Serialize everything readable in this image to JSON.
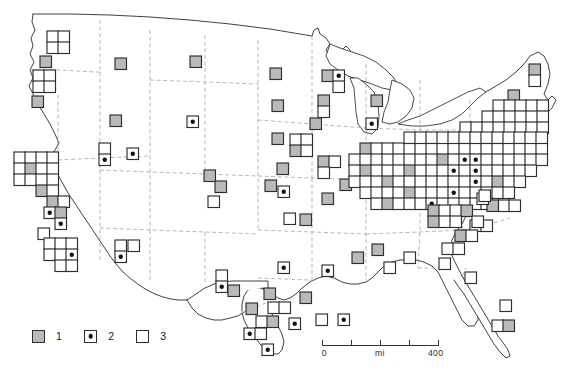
{
  "figure": {
    "projection": "conterminous United States, state boundaries shown dashed"
  },
  "legend": {
    "name": "map-legend",
    "entries": [
      {
        "symbol": "filled-gray-square",
        "label": "1"
      },
      {
        "symbol": "square-with-center-dot",
        "label": "2"
      },
      {
        "symbol": "open-white-square",
        "label": "3"
      }
    ]
  },
  "scalebar": {
    "unit_label": "mi",
    "min_label": "0",
    "max_label": "400",
    "ticks": [
      0,
      25,
      50,
      75,
      100
    ]
  },
  "colors": {
    "cell_fill_class1": "#b9b9b9",
    "cell_fill_class3": "#ffffff",
    "cell_stroke": "#2e2e2e",
    "dot": "#111111",
    "coastline": "#2b2b2b",
    "state_boundary": "#9a9a9a",
    "background": "#ffffff"
  },
  "caption": "",
  "chart_data": {
    "type": "heatmap",
    "xlabel": "",
    "ylabel": "",
    "grid": true,
    "legend_position": "bottom-left",
    "cell_size_px": 11.5,
    "categories": [
      "1",
      "2",
      "3"
    ],
    "category_meaning": {
      "1": "filled gray square",
      "2": "square with central black dot",
      "3": "open (unfilled) square"
    },
    "cells": [
      {
        "x": 47,
        "y": 31,
        "c": "3"
      },
      {
        "x": 58,
        "y": 31,
        "c": "3"
      },
      {
        "x": 47,
        "y": 42,
        "c": "3"
      },
      {
        "x": 58,
        "y": 42,
        "c": "3"
      },
      {
        "x": 40,
        "y": 56,
        "c": "1"
      },
      {
        "x": 33,
        "y": 70,
        "c": "3"
      },
      {
        "x": 44,
        "y": 70,
        "c": "3"
      },
      {
        "x": 33,
        "y": 81,
        "c": "3"
      },
      {
        "x": 44,
        "y": 81,
        "c": "3"
      },
      {
        "x": 32,
        "y": 96,
        "c": "1"
      },
      {
        "x": 115,
        "y": 58,
        "c": "1"
      },
      {
        "x": 110,
        "y": 115,
        "c": "1"
      },
      {
        "x": 99,
        "y": 143,
        "c": "3"
      },
      {
        "x": 99,
        "y": 154,
        "c": "2"
      },
      {
        "x": 127,
        "y": 148,
        "c": "2"
      },
      {
        "x": 115,
        "y": 240,
        "c": "3"
      },
      {
        "x": 115,
        "y": 251,
        "c": "2"
      },
      {
        "x": 128,
        "y": 240,
        "c": "3"
      },
      {
        "x": 190,
        "y": 56,
        "c": "1"
      },
      {
        "x": 187,
        "y": 116,
        "c": "2"
      },
      {
        "x": 204,
        "y": 170,
        "c": "1"
      },
      {
        "x": 215,
        "y": 181,
        "c": "1"
      },
      {
        "x": 208,
        "y": 196,
        "c": "3"
      },
      {
        "x": 216,
        "y": 270,
        "c": "3"
      },
      {
        "x": 216,
        "y": 281,
        "c": "2"
      },
      {
        "x": 228,
        "y": 285,
        "c": "1"
      },
      {
        "x": 14,
        "y": 152,
        "c": "3"
      },
      {
        "x": 25,
        "y": 152,
        "c": "3"
      },
      {
        "x": 36,
        "y": 152,
        "c": "3"
      },
      {
        "x": 47,
        "y": 152,
        "c": "3"
      },
      {
        "x": 14,
        "y": 163,
        "c": "3"
      },
      {
        "x": 25,
        "y": 163,
        "c": "1"
      },
      {
        "x": 36,
        "y": 163,
        "c": "3"
      },
      {
        "x": 47,
        "y": 163,
        "c": "3"
      },
      {
        "x": 14,
        "y": 174,
        "c": "3"
      },
      {
        "x": 25,
        "y": 174,
        "c": "3"
      },
      {
        "x": 36,
        "y": 174,
        "c": "3"
      },
      {
        "x": 47,
        "y": 174,
        "c": "3"
      },
      {
        "x": 36,
        "y": 185,
        "c": "1"
      },
      {
        "x": 47,
        "y": 185,
        "c": "3"
      },
      {
        "x": 47,
        "y": 196,
        "c": "1"
      },
      {
        "x": 58,
        "y": 196,
        "c": "3"
      },
      {
        "x": 44,
        "y": 207,
        "c": "2"
      },
      {
        "x": 55,
        "y": 207,
        "c": "1"
      },
      {
        "x": 55,
        "y": 218,
        "c": "2"
      },
      {
        "x": 38,
        "y": 228,
        "c": "3"
      },
      {
        "x": 44,
        "y": 238,
        "c": "3"
      },
      {
        "x": 55,
        "y": 238,
        "c": "3"
      },
      {
        "x": 66,
        "y": 238,
        "c": "3"
      },
      {
        "x": 44,
        "y": 249,
        "c": "3"
      },
      {
        "x": 55,
        "y": 249,
        "c": "3"
      },
      {
        "x": 66,
        "y": 249,
        "c": "2"
      },
      {
        "x": 55,
        "y": 260,
        "c": "3"
      },
      {
        "x": 66,
        "y": 260,
        "c": "3"
      },
      {
        "x": 270,
        "y": 68,
        "c": "1"
      },
      {
        "x": 322,
        "y": 70,
        "c": "1"
      },
      {
        "x": 333,
        "y": 70,
        "c": "2"
      },
      {
        "x": 333,
        "y": 81,
        "c": "3"
      },
      {
        "x": 272,
        "y": 100,
        "c": "1"
      },
      {
        "x": 318,
        "y": 95,
        "c": "1"
      },
      {
        "x": 318,
        "y": 106,
        "c": "3"
      },
      {
        "x": 310,
        "y": 118,
        "c": "1"
      },
      {
        "x": 272,
        "y": 133,
        "c": "1"
      },
      {
        "x": 290,
        "y": 134,
        "c": "3"
      },
      {
        "x": 301,
        "y": 134,
        "c": "3"
      },
      {
        "x": 290,
        "y": 145,
        "c": "1"
      },
      {
        "x": 301,
        "y": 145,
        "c": "3"
      },
      {
        "x": 277,
        "y": 163,
        "c": "1"
      },
      {
        "x": 278,
        "y": 186,
        "c": "2"
      },
      {
        "x": 265,
        "y": 180,
        "c": "1"
      },
      {
        "x": 318,
        "y": 156,
        "c": "1"
      },
      {
        "x": 329,
        "y": 156,
        "c": "3"
      },
      {
        "x": 318,
        "y": 167,
        "c": "3"
      },
      {
        "x": 340,
        "y": 179,
        "c": "1"
      },
      {
        "x": 322,
        "y": 193,
        "c": "1"
      },
      {
        "x": 284,
        "y": 213,
        "c": "3"
      },
      {
        "x": 300,
        "y": 214,
        "c": "1"
      },
      {
        "x": 278,
        "y": 262,
        "c": "2"
      },
      {
        "x": 322,
        "y": 265,
        "c": "2"
      },
      {
        "x": 300,
        "y": 292,
        "c": "1"
      },
      {
        "x": 264,
        "y": 288,
        "c": "1"
      },
      {
        "x": 246,
        "y": 303,
        "c": "1"
      },
      {
        "x": 268,
        "y": 302,
        "c": "3"
      },
      {
        "x": 279,
        "y": 302,
        "c": "3"
      },
      {
        "x": 256,
        "y": 316,
        "c": "3"
      },
      {
        "x": 267,
        "y": 316,
        "c": "1"
      },
      {
        "x": 244,
        "y": 328,
        "c": "2"
      },
      {
        "x": 255,
        "y": 328,
        "c": "3"
      },
      {
        "x": 262,
        "y": 344,
        "c": "2"
      },
      {
        "x": 289,
        "y": 318,
        "c": "2"
      },
      {
        "x": 316,
        "y": 314,
        "c": "3"
      },
      {
        "x": 338,
        "y": 314,
        "c": "2"
      },
      {
        "x": 352,
        "y": 252,
        "c": "1"
      },
      {
        "x": 372,
        "y": 244,
        "c": "1"
      },
      {
        "x": 384,
        "y": 262,
        "c": "3"
      },
      {
        "x": 404,
        "y": 252,
        "c": "3"
      },
      {
        "x": 360,
        "y": 143,
        "c": "1"
      },
      {
        "x": 371,
        "y": 143,
        "c": "3"
      },
      {
        "x": 382,
        "y": 143,
        "c": "3"
      },
      {
        "x": 393,
        "y": 143,
        "c": "3"
      },
      {
        "x": 404,
        "y": 143,
        "c": "3"
      },
      {
        "x": 415,
        "y": 143,
        "c": "3"
      },
      {
        "x": 426,
        "y": 143,
        "c": "3"
      },
      {
        "x": 437,
        "y": 143,
        "c": "3"
      },
      {
        "x": 448,
        "y": 143,
        "c": "3"
      },
      {
        "x": 459,
        "y": 143,
        "c": "3"
      },
      {
        "x": 470,
        "y": 143,
        "c": "3"
      },
      {
        "x": 481,
        "y": 143,
        "c": "3"
      },
      {
        "x": 492,
        "y": 143,
        "c": "3"
      },
      {
        "x": 503,
        "y": 143,
        "c": "3"
      },
      {
        "x": 514,
        "y": 143,
        "c": "3"
      },
      {
        "x": 525,
        "y": 143,
        "c": "3"
      },
      {
        "x": 536,
        "y": 143,
        "c": "3"
      },
      {
        "x": 349,
        "y": 154,
        "c": "3"
      },
      {
        "x": 360,
        "y": 154,
        "c": "3"
      },
      {
        "x": 371,
        "y": 154,
        "c": "3"
      },
      {
        "x": 382,
        "y": 154,
        "c": "3"
      },
      {
        "x": 393,
        "y": 154,
        "c": "3"
      },
      {
        "x": 404,
        "y": 154,
        "c": "3"
      },
      {
        "x": 415,
        "y": 154,
        "c": "3"
      },
      {
        "x": 426,
        "y": 154,
        "c": "3"
      },
      {
        "x": 437,
        "y": 154,
        "c": "1"
      },
      {
        "x": 448,
        "y": 154,
        "c": "3"
      },
      {
        "x": 459,
        "y": 154,
        "c": "2"
      },
      {
        "x": 470,
        "y": 154,
        "c": "2"
      },
      {
        "x": 481,
        "y": 154,
        "c": "3"
      },
      {
        "x": 492,
        "y": 154,
        "c": "3"
      },
      {
        "x": 503,
        "y": 154,
        "c": "3"
      },
      {
        "x": 514,
        "y": 154,
        "c": "3"
      },
      {
        "x": 525,
        "y": 154,
        "c": "3"
      },
      {
        "x": 536,
        "y": 154,
        "c": "3"
      },
      {
        "x": 349,
        "y": 165,
        "c": "3"
      },
      {
        "x": 360,
        "y": 165,
        "c": "1"
      },
      {
        "x": 371,
        "y": 165,
        "c": "3"
      },
      {
        "x": 382,
        "y": 165,
        "c": "3"
      },
      {
        "x": 393,
        "y": 165,
        "c": "3"
      },
      {
        "x": 404,
        "y": 165,
        "c": "1"
      },
      {
        "x": 415,
        "y": 165,
        "c": "3"
      },
      {
        "x": 426,
        "y": 165,
        "c": "3"
      },
      {
        "x": 437,
        "y": 165,
        "c": "3"
      },
      {
        "x": 448,
        "y": 165,
        "c": "2"
      },
      {
        "x": 459,
        "y": 165,
        "c": "3"
      },
      {
        "x": 470,
        "y": 165,
        "c": "2"
      },
      {
        "x": 481,
        "y": 165,
        "c": "3"
      },
      {
        "x": 492,
        "y": 165,
        "c": "3"
      },
      {
        "x": 503,
        "y": 165,
        "c": "3"
      },
      {
        "x": 514,
        "y": 165,
        "c": "3"
      },
      {
        "x": 525,
        "y": 165,
        "c": "3"
      },
      {
        "x": 349,
        "y": 176,
        "c": "3"
      },
      {
        "x": 360,
        "y": 176,
        "c": "3"
      },
      {
        "x": 371,
        "y": 176,
        "c": "3"
      },
      {
        "x": 382,
        "y": 176,
        "c": "1"
      },
      {
        "x": 393,
        "y": 176,
        "c": "3"
      },
      {
        "x": 404,
        "y": 176,
        "c": "3"
      },
      {
        "x": 415,
        "y": 176,
        "c": "3"
      },
      {
        "x": 426,
        "y": 176,
        "c": "3"
      },
      {
        "x": 437,
        "y": 176,
        "c": "3"
      },
      {
        "x": 448,
        "y": 176,
        "c": "3"
      },
      {
        "x": 459,
        "y": 176,
        "c": "3"
      },
      {
        "x": 470,
        "y": 176,
        "c": "2"
      },
      {
        "x": 481,
        "y": 176,
        "c": "3"
      },
      {
        "x": 492,
        "y": 176,
        "c": "1"
      },
      {
        "x": 503,
        "y": 176,
        "c": "3"
      },
      {
        "x": 514,
        "y": 176,
        "c": "3"
      },
      {
        "x": 360,
        "y": 187,
        "c": "3"
      },
      {
        "x": 371,
        "y": 187,
        "c": "3"
      },
      {
        "x": 382,
        "y": 187,
        "c": "3"
      },
      {
        "x": 393,
        "y": 187,
        "c": "3"
      },
      {
        "x": 404,
        "y": 187,
        "c": "1"
      },
      {
        "x": 415,
        "y": 187,
        "c": "3"
      },
      {
        "x": 426,
        "y": 187,
        "c": "3"
      },
      {
        "x": 437,
        "y": 187,
        "c": "3"
      },
      {
        "x": 448,
        "y": 187,
        "c": "2"
      },
      {
        "x": 459,
        "y": 187,
        "c": "3"
      },
      {
        "x": 470,
        "y": 187,
        "c": "3"
      },
      {
        "x": 481,
        "y": 187,
        "c": "3"
      },
      {
        "x": 492,
        "y": 187,
        "c": "3"
      },
      {
        "x": 503,
        "y": 187,
        "c": "3"
      },
      {
        "x": 371,
        "y": 198,
        "c": "3"
      },
      {
        "x": 382,
        "y": 198,
        "c": "1"
      },
      {
        "x": 393,
        "y": 198,
        "c": "3"
      },
      {
        "x": 404,
        "y": 198,
        "c": "3"
      },
      {
        "x": 415,
        "y": 198,
        "c": "3"
      },
      {
        "x": 426,
        "y": 198,
        "c": "2"
      },
      {
        "x": 437,
        "y": 198,
        "c": "3"
      },
      {
        "x": 448,
        "y": 198,
        "c": "3"
      },
      {
        "x": 459,
        "y": 198,
        "c": "3"
      },
      {
        "x": 470,
        "y": 198,
        "c": "3"
      },
      {
        "x": 481,
        "y": 198,
        "c": "3"
      },
      {
        "x": 428,
        "y": 205,
        "c": "1"
      },
      {
        "x": 439,
        "y": 205,
        "c": "3"
      },
      {
        "x": 450,
        "y": 205,
        "c": "3"
      },
      {
        "x": 461,
        "y": 205,
        "c": "1"
      },
      {
        "x": 428,
        "y": 216,
        "c": "1"
      },
      {
        "x": 439,
        "y": 216,
        "c": "3"
      },
      {
        "x": 450,
        "y": 216,
        "c": "3"
      },
      {
        "x": 470,
        "y": 220,
        "c": "3"
      },
      {
        "x": 481,
        "y": 220,
        "c": "3"
      },
      {
        "x": 529,
        "y": 64,
        "c": "1"
      },
      {
        "x": 529,
        "y": 75,
        "c": "3"
      },
      {
        "x": 508,
        "y": 90,
        "c": "1"
      },
      {
        "x": 493,
        "y": 100,
        "c": "3"
      },
      {
        "x": 504,
        "y": 100,
        "c": "3"
      },
      {
        "x": 515,
        "y": 100,
        "c": "3"
      },
      {
        "x": 526,
        "y": 100,
        "c": "3"
      },
      {
        "x": 537,
        "y": 100,
        "c": "3"
      },
      {
        "x": 482,
        "y": 111,
        "c": "3"
      },
      {
        "x": 493,
        "y": 111,
        "c": "3"
      },
      {
        "x": 504,
        "y": 111,
        "c": "3"
      },
      {
        "x": 515,
        "y": 111,
        "c": "3"
      },
      {
        "x": 526,
        "y": 111,
        "c": "3"
      },
      {
        "x": 537,
        "y": 111,
        "c": "3"
      },
      {
        "x": 460,
        "y": 122,
        "c": "3"
      },
      {
        "x": 471,
        "y": 122,
        "c": "3"
      },
      {
        "x": 482,
        "y": 122,
        "c": "3"
      },
      {
        "x": 493,
        "y": 122,
        "c": "3"
      },
      {
        "x": 504,
        "y": 122,
        "c": "3"
      },
      {
        "x": 515,
        "y": 122,
        "c": "3"
      },
      {
        "x": 526,
        "y": 122,
        "c": "3"
      },
      {
        "x": 537,
        "y": 122,
        "c": "3"
      },
      {
        "x": 404,
        "y": 132,
        "c": "3"
      },
      {
        "x": 415,
        "y": 132,
        "c": "3"
      },
      {
        "x": 426,
        "y": 132,
        "c": "3"
      },
      {
        "x": 437,
        "y": 132,
        "c": "3"
      },
      {
        "x": 448,
        "y": 132,
        "c": "3"
      },
      {
        "x": 459,
        "y": 132,
        "c": "3"
      },
      {
        "x": 470,
        "y": 132,
        "c": "3"
      },
      {
        "x": 481,
        "y": 132,
        "c": "3"
      },
      {
        "x": 492,
        "y": 132,
        "c": "3"
      },
      {
        "x": 503,
        "y": 132,
        "c": "3"
      },
      {
        "x": 514,
        "y": 132,
        "c": "3"
      },
      {
        "x": 525,
        "y": 132,
        "c": "3"
      },
      {
        "x": 536,
        "y": 132,
        "c": "3"
      },
      {
        "x": 371,
        "y": 95,
        "c": "1"
      },
      {
        "x": 366,
        "y": 118,
        "c": "2"
      },
      {
        "x": 455,
        "y": 230,
        "c": "1"
      },
      {
        "x": 466,
        "y": 230,
        "c": "3"
      },
      {
        "x": 472,
        "y": 216,
        "c": "3"
      },
      {
        "x": 498,
        "y": 200,
        "c": "3"
      },
      {
        "x": 509,
        "y": 200,
        "c": "3"
      },
      {
        "x": 442,
        "y": 243,
        "c": "3"
      },
      {
        "x": 453,
        "y": 243,
        "c": "3"
      },
      {
        "x": 439,
        "y": 258,
        "c": "3"
      },
      {
        "x": 465,
        "y": 272,
        "c": "3"
      },
      {
        "x": 487,
        "y": 200,
        "c": "1"
      },
      {
        "x": 477,
        "y": 193,
        "c": "3"
      },
      {
        "x": 492,
        "y": 320,
        "c": "3"
      },
      {
        "x": 503,
        "y": 320,
        "c": "1"
      },
      {
        "x": 500,
        "y": 300,
        "c": "3"
      },
      {
        "x": 479,
        "y": 190,
        "c": "3"
      }
    ]
  }
}
